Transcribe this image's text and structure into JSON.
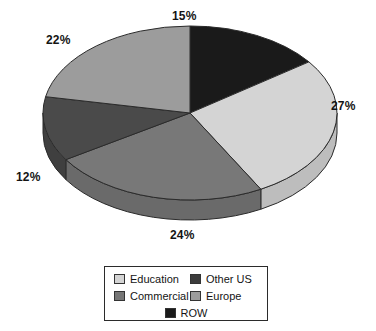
{
  "chart_data": {
    "type": "pie",
    "title": "",
    "three_d": true,
    "start_angle_deg": 0,
    "direction": "clockwise",
    "categories": [
      "ROW",
      "Education",
      "Commercial",
      "Other US",
      "Europe"
    ],
    "values": [
      15,
      27,
      24,
      12,
      22
    ],
    "unit": "%",
    "data_labels": [
      "15%",
      "27%",
      "24%",
      "12%",
      "22%"
    ],
    "colors": [
      "#1a1a1a",
      "#d4d4d4",
      "#787878",
      "#4a4a4a",
      "#9c9c9c"
    ],
    "legend_position": "bottom",
    "grid": false,
    "slices": [
      {
        "label": "ROW",
        "value": 15,
        "data_label": "15%",
        "color": "#1a1a1a",
        "side_color": "#121212",
        "label_pos": "top"
      },
      {
        "label": "Education",
        "value": 27,
        "data_label": "27%",
        "color": "#d4d4d4",
        "side_color": "#bdbdbd",
        "label_pos": "right"
      },
      {
        "label": "Commercial",
        "value": 24,
        "data_label": "24%",
        "color": "#787878",
        "side_color": "#6a6a6a",
        "label_pos": "bottom"
      },
      {
        "label": "Other US",
        "value": 12,
        "data_label": "12%",
        "color": "#4a4a4a",
        "side_color": "#3f3f3f",
        "label_pos": "left"
      },
      {
        "label": "Europe",
        "value": 22,
        "data_label": "22%",
        "color": "#9c9c9c",
        "side_color": "#8a8a8a",
        "label_pos": "upper-left"
      }
    ]
  },
  "labels": {
    "row": "15%",
    "education": "27%",
    "commercial": "24%",
    "other_us": "12%",
    "europe": "22%"
  },
  "legend": {
    "rows": [
      {
        "left": {
          "label": "Education",
          "color": "#d4d4d4"
        },
        "right": {
          "label": "Other US",
          "color": "#3c3c3c"
        }
      },
      {
        "left": {
          "label": "Commercial",
          "color": "#767676"
        },
        "right": {
          "label": "Europe",
          "color": "#9c9c9c"
        }
      }
    ],
    "center_row": {
      "label": "ROW",
      "color": "#1a1a1a"
    }
  }
}
